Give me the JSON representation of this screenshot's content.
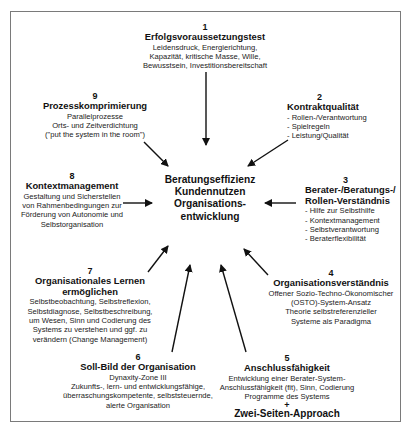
{
  "center": {
    "lines": [
      "Beratungseffizienz",
      "Kundennutzen",
      "Organisations-",
      "entwicklung"
    ]
  },
  "nodes": [
    {
      "num": "1",
      "title": "Erfolgsvoraussetzungstest",
      "lines": [
        "Leidensdruck, Energierichtung,",
        "Kapazität, kritische Masse, Wille,",
        "Bewusstsein, Investitionsbereitschaft"
      ]
    },
    {
      "num": "2",
      "title": "Kontraktqualität",
      "lines": [
        "- Rollen-/Verantwortung",
        "- Spielregeln",
        "- Leistung/Qualität"
      ]
    },
    {
      "num": "3",
      "title_lines": [
        "Berater-/Beratungs-/",
        "Rollen-Verständnis"
      ],
      "lines": [
        "- Hilfe zur Selbsthilfe",
        "- Kontextmanagement",
        "- Selbstverantwortung",
        "- Beraterflexibilität"
      ]
    },
    {
      "num": "4",
      "title": "Organisationsverständnis",
      "lines": [
        "Offener Sozio-Techno-Ökonomischer",
        "(OSTO)-System-Ansatz",
        "Theorie selbstreferenzieller",
        "Systeme als Paradigma"
      ]
    },
    {
      "num": "5",
      "title": "Anschlussfähigkeit",
      "lines": [
        "Entwicklung einer Berater-System-",
        "Anschlussfähigkeit (fit), Sinn, Codierung",
        "Programme des Systems"
      ],
      "plus": "+",
      "extra_title": "Zwei-Seiten-Approach"
    },
    {
      "num": "6",
      "title": "Soll-Bild der Organisation",
      "lines": [
        "Dynaxity-Zone III",
        "Zukunfts-, lern- und entwicklungsfähige,",
        "überraschungskompetente, selbststeuernde,",
        "alerte Organisation"
      ]
    },
    {
      "num": "7",
      "title_lines": [
        "Organisationales Lernen",
        "ermöglichen"
      ],
      "lines": [
        "Selbstbeobachtung, Selbstreflexion,",
        "Selbstdiagnose, Selbstbeschreibung,",
        "um Wesen, Sinn und Codierung des",
        "Systems zu verstehen und ggf. zu",
        "verändern (Change Management)"
      ]
    },
    {
      "num": "8",
      "title": "Kontextmanagement",
      "lines": [
        "Gestaltung und Sicherstellen",
        "von Rahmenbedingungen zur",
        "Förderung von Autonomie und",
        "Selbstorganisation"
      ]
    },
    {
      "num": "9",
      "title": "Prozesskomprimierung",
      "lines": [
        "Parallelprozesse",
        "Orts- und Zeitverdichtung",
        "(\"put the system in the room\")"
      ]
    }
  ],
  "colors": {
    "text": "#111111",
    "frame": "#7a7a7a",
    "arrow": "#111111",
    "background": "#ffffff"
  }
}
